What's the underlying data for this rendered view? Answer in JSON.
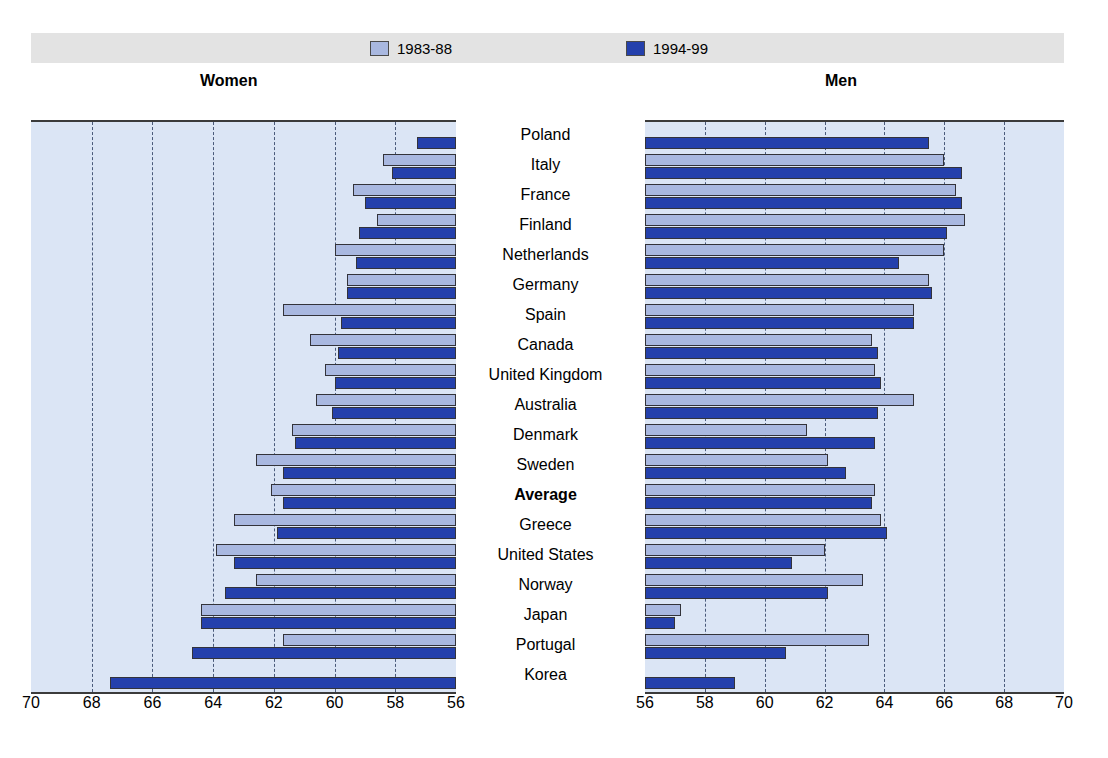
{
  "legend": {
    "items": [
      {
        "label": "1983-88",
        "color": "#a9b8e0",
        "swatch": "legend-swatch-1983-88"
      },
      {
        "label": "1994-99",
        "color": "#2440ac",
        "swatch": "legend-swatch-1994-99"
      }
    ]
  },
  "panels": {
    "left_title": "Women",
    "right_title": "Men"
  },
  "chart_data": {
    "type": "bar",
    "title": "",
    "subtitle": "",
    "orientation": "horizontal",
    "layout": "paired mirrored panels (Women left, Men right) sharing a central category axis",
    "grid": true,
    "legend_position": "top-center",
    "categories": [
      "Poland",
      "Italy",
      "France",
      "Finland",
      "Netherlands",
      "Germany",
      "Spain",
      "Canada",
      "United Kingdom",
      "Australia",
      "Denmark",
      "Sweden",
      "Average",
      "Greece",
      "United States",
      "Norway",
      "Japan",
      "Portugal",
      "Korea"
    ],
    "emphasized_categories": [
      "Average"
    ],
    "panels": [
      {
        "name": "Women",
        "xlabel": "",
        "ylabel": "",
        "xlim": [
          70,
          56
        ],
        "axis_direction": "decreasing left-to-right",
        "ticks": [
          70,
          68,
          66,
          64,
          62,
          60,
          58,
          56
        ],
        "tick_labels": [
          "70",
          "68",
          "66",
          "64",
          "62",
          "60",
          "58",
          "56"
        ],
        "series": [
          {
            "name": "1983-88",
            "color": "#a9b8e0",
            "values": [
              null,
              58.4,
              59.4,
              58.6,
              60.0,
              59.6,
              61.7,
              60.8,
              60.3,
              60.6,
              61.4,
              62.6,
              62.1,
              63.3,
              63.9,
              62.6,
              64.4,
              61.7,
              null
            ]
          },
          {
            "name": "1994-99",
            "color": "#2440ac",
            "values": [
              57.3,
              58.1,
              59.0,
              59.2,
              59.3,
              59.6,
              59.8,
              59.9,
              60.0,
              60.1,
              61.3,
              61.7,
              61.7,
              61.9,
              63.3,
              63.6,
              64.4,
              64.7,
              67.4
            ]
          }
        ]
      },
      {
        "name": "Men",
        "xlabel": "",
        "ylabel": "",
        "xlim": [
          56,
          70
        ],
        "axis_direction": "increasing left-to-right",
        "ticks": [
          56,
          58,
          60,
          62,
          64,
          66,
          68,
          70
        ],
        "tick_labels": [
          "56",
          "58",
          "60",
          "62",
          "64",
          "66",
          "68",
          "70"
        ],
        "series": [
          {
            "name": "1983-88",
            "color": "#a9b8e0",
            "values": [
              null,
              60.0,
              59.6,
              59.3,
              60.0,
              60.5,
              61.0,
              62.4,
              62.3,
              61.0,
              64.6,
              63.9,
              62.3,
              62.1,
              64.0,
              62.7,
              68.8,
              62.5,
              null
            ]
          },
          {
            "name": "1994-99",
            "color": "#2440ac",
            "values": [
              60.5,
              59.4,
              59.4,
              59.9,
              61.5,
              60.4,
              61.0,
              62.2,
              62.1,
              62.2,
              62.3,
              63.3,
              62.4,
              61.9,
              65.1,
              63.9,
              69.0,
              65.3,
              67.0
            ]
          }
        ]
      }
    ]
  }
}
